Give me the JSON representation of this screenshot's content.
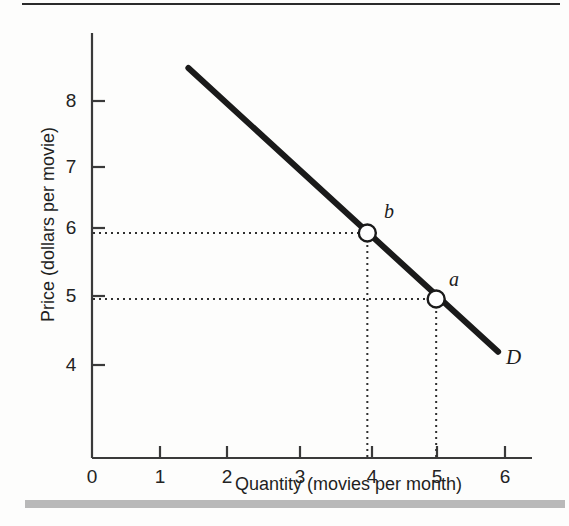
{
  "figure": {
    "top_rule": true,
    "bottom_band": true
  },
  "chart_data": {
    "type": "line",
    "title": "",
    "xlabel": "Quantity (movies per month)",
    "ylabel": "Price (dollars per movie)",
    "xlim": [
      0,
      6.4
    ],
    "ylim": [
      3.3,
      8.9
    ],
    "grid": false,
    "legend": "none",
    "x_ticks": [
      "0",
      "1",
      "2",
      "3",
      "4",
      "5",
      "6"
    ],
    "x_tick_values": [
      0,
      1,
      2,
      3,
      4,
      5,
      6
    ],
    "y_ticks": [
      "4",
      "5",
      "6",
      "7",
      "8"
    ],
    "y_tick_values": [
      4,
      5,
      6,
      7,
      8
    ],
    "series": [
      {
        "name": "D",
        "label": "D",
        "label_position": "end-right",
        "color": "#1a1a1a",
        "linewidth": 5,
        "x": [
          1.4,
          5.9
        ],
        "y": [
          8.5,
          4.2
        ]
      }
    ],
    "points": [
      {
        "label": "b",
        "x": 4,
        "y": 6,
        "marker": "open-circle",
        "label_offset": "upper-right"
      },
      {
        "label": "a",
        "x": 5,
        "y": 5,
        "marker": "open-circle",
        "label_offset": "upper-right"
      }
    ],
    "guide_lines": [
      {
        "type": "horizontal",
        "y": 6,
        "from_x": 0,
        "to_x": 4,
        "style": "dotted"
      },
      {
        "type": "vertical",
        "x": 4,
        "from_y": 3.3,
        "to_y": 6,
        "style": "dotted"
      },
      {
        "type": "horizontal",
        "y": 5,
        "from_x": 0,
        "to_x": 5,
        "style": "dotted"
      },
      {
        "type": "vertical",
        "x": 5,
        "from_y": 3.3,
        "to_y": 5,
        "style": "dotted"
      }
    ],
    "annotations": [
      {
        "text": "D",
        "meaning": "demand-curve-label"
      },
      {
        "text": "a",
        "meaning": "point-a-quantity-5-price-5"
      },
      {
        "text": "b",
        "meaning": "point-b-quantity-4-price-6"
      }
    ]
  },
  "colors": {
    "curve": "#1a1a1a",
    "axis": "#3a3a3a",
    "guide": "#3a3a3a",
    "band": "#b9b9b9",
    "rule": "#2b2b2b",
    "marker_fill": "#ffffff"
  }
}
